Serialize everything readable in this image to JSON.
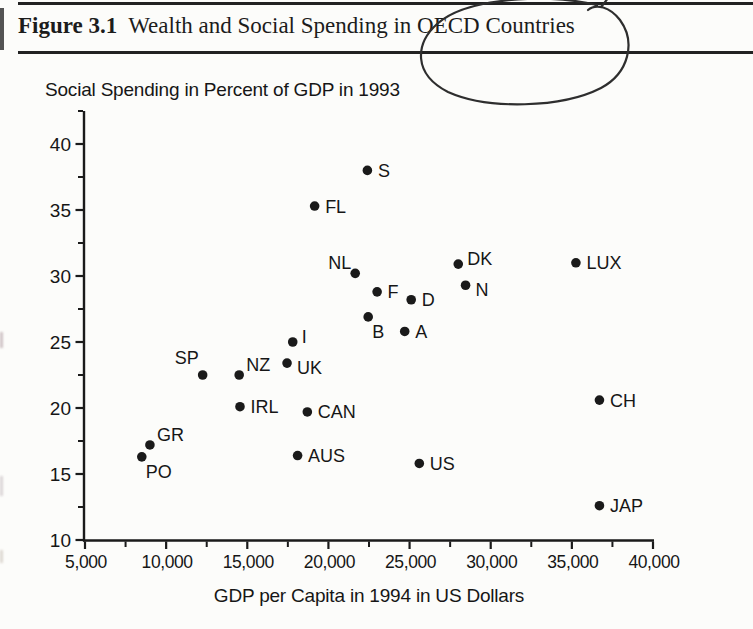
{
  "header": {
    "figure_label": "Figure 3.1",
    "figure_title": "Wealth and Social Spending in OECD Countries",
    "annotation": {
      "type": "hand-drawn pen ellipse",
      "around": "OECD Countries"
    }
  },
  "chart_data": {
    "type": "scatter",
    "title": "Social Spending in Percent of GDP in 1993",
    "xlabel": "GDP per Capita in 1994 in US Dollars",
    "ylabel": "Social Spending in Percent of GDP in 1993",
    "xlim": [
      5000,
      40000
    ],
    "ylim": [
      10,
      42.5
    ],
    "grid": false,
    "legend": false,
    "marker_color": "#1a1a1a",
    "axis_color": "#1a1a1a",
    "x_ticks": [
      {
        "value": 5000,
        "label": "5,000"
      },
      {
        "value": 10000,
        "label": "10,000"
      },
      {
        "value": 15000,
        "label": "15,000"
      },
      {
        "value": 20000,
        "label": "20,000"
      },
      {
        "value": 25000,
        "label": "25,000"
      },
      {
        "value": 30000,
        "label": "30,000"
      },
      {
        "value": 35000,
        "label": "35,000"
      },
      {
        "value": 40000,
        "label": "40,000"
      }
    ],
    "x_minor_ticks": [
      7500,
      12500,
      17500,
      22500,
      27500,
      32500,
      37500
    ],
    "y_ticks": [
      {
        "value": 10,
        "label": "10"
      },
      {
        "value": 15,
        "label": "15"
      },
      {
        "value": 20,
        "label": "20"
      },
      {
        "value": 25,
        "label": "25"
      },
      {
        "value": 30,
        "label": "30"
      },
      {
        "value": 35,
        "label": "35"
      },
      {
        "value": 40,
        "label": "40"
      }
    ],
    "y_minor_ticks": [
      12.5,
      17.5,
      22.5,
      27.5,
      32.5,
      37.5,
      42.5
    ],
    "points": [
      {
        "label": "S",
        "x": 22400,
        "y": 38.0,
        "label_pos": "right"
      },
      {
        "label": "FL",
        "x": 19150,
        "y": 35.3,
        "label_pos": "right"
      },
      {
        "label": "DK",
        "x": 28000,
        "y": 30.9,
        "label_pos": "right-up"
      },
      {
        "label": "LUX",
        "x": 35250,
        "y": 31.0,
        "label_pos": "right"
      },
      {
        "label": "NL",
        "x": 21650,
        "y": 30.2,
        "label_pos": "above-left"
      },
      {
        "label": "N",
        "x": 28450,
        "y": 29.3,
        "label_pos": "right-down"
      },
      {
        "label": "F",
        "x": 23000,
        "y": 28.8,
        "label_pos": "right"
      },
      {
        "label": "D",
        "x": 25100,
        "y": 28.2,
        "label_pos": "right"
      },
      {
        "label": "B",
        "x": 22450,
        "y": 26.9,
        "label_pos": "below-right"
      },
      {
        "label": "A",
        "x": 24700,
        "y": 25.8,
        "label_pos": "right"
      },
      {
        "label": "I",
        "x": 17800,
        "y": 25.0,
        "label_pos": "right-up"
      },
      {
        "label": "UK",
        "x": 17450,
        "y": 23.4,
        "label_pos": "right-down"
      },
      {
        "label": "NZ",
        "x": 14500,
        "y": 22.5,
        "label_pos": "above-right"
      },
      {
        "label": "SP",
        "x": 12250,
        "y": 22.5,
        "label_pos": "above-left-far"
      },
      {
        "label": "IRL",
        "x": 14550,
        "y": 20.1,
        "label_pos": "right"
      },
      {
        "label": "CAN",
        "x": 18700,
        "y": 19.7,
        "label_pos": "right"
      },
      {
        "label": "GR",
        "x": 9000,
        "y": 17.2,
        "label_pos": "above-right"
      },
      {
        "label": "PO",
        "x": 8500,
        "y": 16.3,
        "label_pos": "below-right"
      },
      {
        "label": "AUS",
        "x": 18100,
        "y": 16.4,
        "label_pos": "right"
      },
      {
        "label": "US",
        "x": 25600,
        "y": 15.8,
        "label_pos": "right"
      },
      {
        "label": "CH",
        "x": 36700,
        "y": 20.6,
        "label_pos": "right"
      },
      {
        "label": "JAP",
        "x": 36700,
        "y": 12.6,
        "label_pos": "right"
      }
    ]
  }
}
